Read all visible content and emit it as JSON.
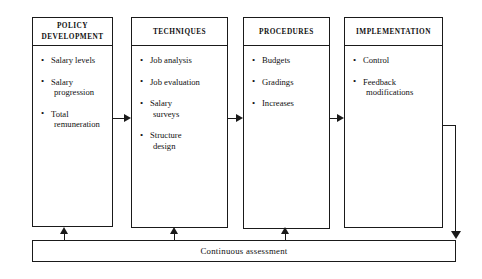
{
  "diagram": {
    "type": "process-flow",
    "stages": [
      {
        "id": "policy-development",
        "header": "POLICY\nDEVELOPMENT",
        "header_lines": [
          "POLICY",
          "DEVELOPMENT"
        ],
        "items": [
          {
            "lines": [
              "Salary levels"
            ]
          },
          {
            "lines": [
              "Salary",
              "progression"
            ]
          },
          {
            "lines": [
              "Total",
              "remuneration"
            ]
          }
        ]
      },
      {
        "id": "techniques",
        "header": "TECHNIQUES",
        "header_lines": [
          "TECHNIQUES"
        ],
        "items": [
          {
            "lines": [
              "Job analysis"
            ]
          },
          {
            "lines": [
              "Job evaluation"
            ]
          },
          {
            "lines": [
              "Salary",
              "surveys"
            ]
          },
          {
            "lines": [
              "Structure",
              "design"
            ]
          }
        ]
      },
      {
        "id": "procedures",
        "header": "PROCEDURES",
        "header_lines": [
          "PROCEDURES"
        ],
        "items": [
          {
            "lines": [
              "Budgets"
            ]
          },
          {
            "lines": [
              "Gradings"
            ]
          },
          {
            "lines": [
              "Increases"
            ]
          }
        ]
      },
      {
        "id": "implementation",
        "header": "IMPLEMENTATION",
        "header_lines": [
          "IMPLEMENTATION"
        ],
        "items": [
          {
            "lines": [
              "Control"
            ]
          },
          {
            "lines": [
              "Feedback",
              "modifications"
            ]
          }
        ]
      }
    ],
    "feedback_bar": {
      "label": "Continuous assessment"
    },
    "colors": {
      "stroke": "#1a1a1a",
      "background": "#ffffff",
      "text": "#111111"
    }
  }
}
